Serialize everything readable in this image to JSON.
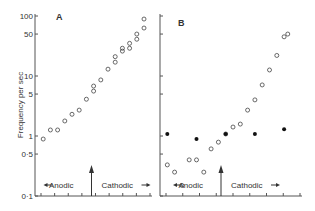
{
  "chart_data": {
    "type": "scatter",
    "ylabel": "Frequency per sec",
    "yscale": "log",
    "ylim": [
      0.1,
      100
    ],
    "yticks": [
      {
        "value": 100,
        "label": "100"
      },
      {
        "value": 50,
        "label": "50"
      },
      {
        "value": 10,
        "label": "10"
      },
      {
        "value": 5,
        "label": "5"
      },
      {
        "value": 1,
        "label": "1"
      },
      {
        "value": 0.5,
        "label": "0·5"
      },
      {
        "value": 0.1,
        "label": "0·1"
      }
    ],
    "panels": [
      {
        "label": "A",
        "x_direction_labels": {
          "left": "Anodic",
          "right": "Cathodic"
        },
        "x_ticks": 8,
        "zero_arrow_x": 8,
        "series": [
          {
            "name": "open",
            "marker": "open-circle",
            "points": [
              {
                "x": 1,
                "y": 0.89
              },
              {
                "x": 2,
                "y": 1.26
              },
              {
                "x": 3,
                "y": 1.26
              },
              {
                "x": 4,
                "y": 1.78
              },
              {
                "x": 5,
                "y": 2.3
              },
              {
                "x": 6,
                "y": 2.7
              },
              {
                "x": 7,
                "y": 4.1
              },
              {
                "x": 8,
                "y": 5.6
              },
              {
                "x": 8,
                "y": 6.8
              },
              {
                "x": 9,
                "y": 8.6
              },
              {
                "x": 10,
                "y": 13
              },
              {
                "x": 11,
                "y": 17
              },
              {
                "x": 11,
                "y": 21
              },
              {
                "x": 12,
                "y": 26
              },
              {
                "x": 12,
                "y": 29
              },
              {
                "x": 13,
                "y": 29
              },
              {
                "x": 13,
                "y": 35
              },
              {
                "x": 14,
                "y": 41
              },
              {
                "x": 14,
                "y": 50
              },
              {
                "x": 15,
                "y": 63
              },
              {
                "x": 15,
                "y": 89
              }
            ]
          }
        ]
      },
      {
        "label": "B",
        "x_direction_labels": {
          "left": "Anodic",
          "right": "Cathodic"
        },
        "x_ticks": 8,
        "zero_arrow_x": 8,
        "series": [
          {
            "name": "open",
            "marker": "open-circle",
            "points": [
              {
                "x": 1,
                "y": 0.33
              },
              {
                "x": 2,
                "y": 0.25
              },
              {
                "x": 3,
                "y": 0.15
              },
              {
                "x": 4,
                "y": 0.4
              },
              {
                "x": 5,
                "y": 0.4
              },
              {
                "x": 6,
                "y": 0.25
              },
              {
                "x": 7,
                "y": 0.61
              },
              {
                "x": 8,
                "y": 0.79
              },
              {
                "x": 9,
                "y": 1.08
              },
              {
                "x": 10,
                "y": 1.41
              },
              {
                "x": 11,
                "y": 1.58
              },
              {
                "x": 12,
                "y": 2.7
              },
              {
                "x": 13,
                "y": 4.0
              },
              {
                "x": 14,
                "y": 7.1
              },
              {
                "x": 15,
                "y": 12.6
              },
              {
                "x": 16,
                "y": 22
              },
              {
                "x": 17,
                "y": 45
              },
              {
                "x": 17.5,
                "y": 50
              }
            ]
          },
          {
            "name": "filled",
            "marker": "filled-circle",
            "points": [
              {
                "x": 1,
                "y": 1.08
              },
              {
                "x": 5,
                "y": 0.89
              },
              {
                "x": 9,
                "y": 1.08
              },
              {
                "x": 13,
                "y": 1.08
              },
              {
                "x": 17,
                "y": 1.3
              }
            ]
          }
        ]
      }
    ]
  }
}
